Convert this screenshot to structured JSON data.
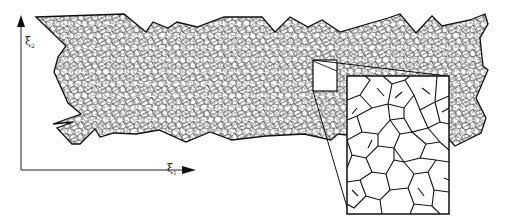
{
  "figure": {
    "axes": {
      "x_label_symbol": "ξ",
      "x_label_index": "1",
      "y_label_symbol": "ξ",
      "y_label_index": "2"
    },
    "colors": {
      "line": "#111111",
      "mesh_line": "#2a2a2a",
      "background": "#ffffff"
    },
    "inset": {
      "source_box": {
        "x": 313,
        "y": 60,
        "w": 24,
        "h": 31
      },
      "magnified_box": {
        "x": 347,
        "y": 76,
        "w": 102,
        "h": 138
      }
    }
  }
}
